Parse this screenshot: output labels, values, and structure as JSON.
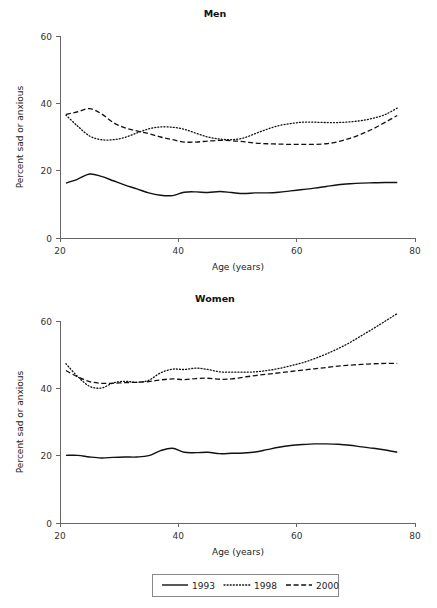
{
  "figure": {
    "width": 437,
    "height": 608,
    "background": "#ffffff",
    "line_color": "#111111"
  },
  "legend": {
    "position": "bottom-center",
    "entries": [
      {
        "label": "1993",
        "style": "solid",
        "sample": "legend-sample-1993"
      },
      {
        "label": "1998",
        "style": "dotted",
        "sample": "legend-sample-1998"
      },
      {
        "label": "2000",
        "style": "dashed",
        "sample": "legend-sample-2000"
      }
    ]
  },
  "chart_data": [
    {
      "type": "line",
      "title": "Men",
      "xlabel": "Age (years)",
      "ylabel": "Percent sad or anxious",
      "xlim": [
        20,
        80
      ],
      "ylim": [
        0,
        60
      ],
      "xticks": [
        20,
        40,
        60,
        80
      ],
      "yticks": [
        0,
        20,
        40,
        60
      ],
      "xtick_labels": [
        "20",
        "40",
        "60",
        "80"
      ],
      "ytick_labels": [
        "0",
        "20",
        "40",
        "60"
      ],
      "grid": false,
      "x": [
        21,
        23,
        25,
        27,
        29,
        31,
        33,
        35,
        37,
        39,
        41,
        43,
        45,
        47,
        49,
        51,
        53,
        55,
        57,
        59,
        61,
        63,
        65,
        67,
        69,
        71,
        73,
        75,
        77
      ],
      "series": [
        {
          "name": "1993",
          "style": "solid",
          "values": [
            16.3,
            17.5,
            19.0,
            18.3,
            17.0,
            15.7,
            14.6,
            13.4,
            12.7,
            12.6,
            13.6,
            13.7,
            13.5,
            13.8,
            13.5,
            13.2,
            13.4,
            13.4,
            13.6,
            14.0,
            14.4,
            14.8,
            15.3,
            15.8,
            16.1,
            16.3,
            16.4,
            16.5,
            16.5
          ]
        },
        {
          "name": "1998",
          "style": "dotted",
          "values": [
            36.5,
            33.2,
            30.3,
            29.2,
            29.2,
            29.9,
            31.2,
            32.4,
            33.0,
            32.9,
            32.3,
            31.1,
            30.0,
            29.4,
            29.2,
            29.7,
            31.0,
            32.3,
            33.4,
            34.0,
            34.4,
            34.4,
            34.3,
            34.3,
            34.5,
            34.9,
            35.6,
            36.7,
            38.6
          ]
        },
        {
          "name": "2000",
          "style": "dashed",
          "values": [
            36.7,
            37.5,
            38.4,
            36.9,
            34.3,
            32.7,
            31.8,
            31.0,
            30.0,
            29.2,
            28.5,
            28.5,
            28.8,
            29.0,
            28.9,
            28.6,
            28.2,
            28.0,
            27.9,
            27.8,
            27.8,
            27.8,
            28.0,
            28.6,
            29.6,
            30.9,
            32.5,
            34.4,
            36.4
          ]
        }
      ]
    },
    {
      "type": "line",
      "title": "Women",
      "xlabel": "Age (years)",
      "ylabel": "Percent sad or anxious",
      "xlim": [
        20,
        80
      ],
      "ylim": [
        0,
        60
      ],
      "xticks": [
        20,
        40,
        60,
        80
      ],
      "yticks": [
        0,
        20,
        40,
        60
      ],
      "xtick_labels": [
        "20",
        "40",
        "60",
        "80"
      ],
      "ytick_labels": [
        "0",
        "20",
        "40",
        "60"
      ],
      "grid": false,
      "x": [
        21,
        23,
        25,
        27,
        29,
        31,
        33,
        35,
        37,
        39,
        41,
        43,
        45,
        47,
        49,
        51,
        53,
        55,
        57,
        59,
        61,
        63,
        65,
        67,
        69,
        71,
        73,
        75,
        77
      ],
      "series": [
        {
          "name": "1993",
          "style": "solid",
          "values": [
            20.1,
            20.1,
            19.6,
            19.3,
            19.5,
            19.6,
            19.6,
            20.0,
            21.5,
            22.2,
            21.0,
            20.9,
            21.0,
            20.6,
            20.7,
            20.8,
            21.1,
            21.8,
            22.5,
            23.0,
            23.3,
            23.5,
            23.5,
            23.4,
            23.1,
            22.6,
            22.2,
            21.7,
            21.0
          ]
        },
        {
          "name": "1998",
          "style": "dotted",
          "values": [
            47.3,
            43.5,
            40.6,
            40.1,
            41.6,
            42.1,
            41.8,
            42.4,
            44.6,
            45.7,
            45.6,
            46.0,
            45.6,
            44.9,
            44.8,
            44.8,
            44.9,
            45.3,
            45.9,
            46.7,
            47.6,
            48.8,
            50.2,
            51.8,
            53.6,
            55.7,
            57.8,
            60.0,
            62.2
          ]
        },
        {
          "name": "2000",
          "style": "dashed",
          "values": [
            45.3,
            43.4,
            42.0,
            41.5,
            41.5,
            41.7,
            41.8,
            42.0,
            42.5,
            42.8,
            42.6,
            42.9,
            43.0,
            42.7,
            42.8,
            43.3,
            43.8,
            44.2,
            44.6,
            45.0,
            45.4,
            45.8,
            46.2,
            46.6,
            46.9,
            47.1,
            47.3,
            47.4,
            47.4
          ]
        }
      ]
    }
  ]
}
